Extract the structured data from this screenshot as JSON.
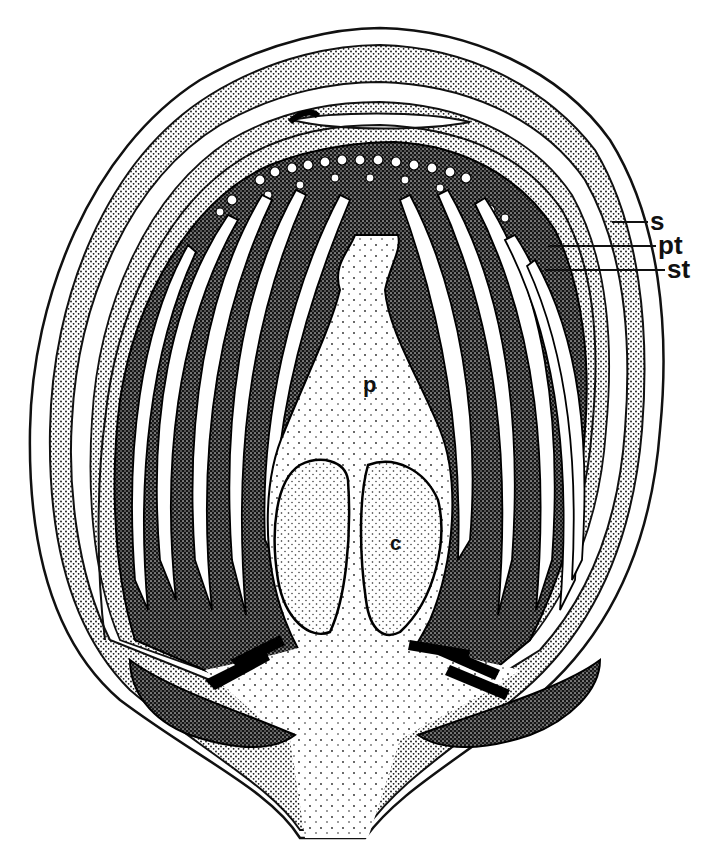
{
  "figure": {
    "labels": {
      "s": "s",
      "pt": "pt",
      "st": "st",
      "p": "p",
      "c": "c"
    }
  },
  "colors": {
    "ink": "#111111",
    "paper": "#ffffff"
  }
}
